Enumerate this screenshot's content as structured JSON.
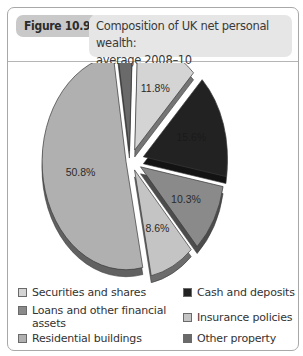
{
  "figure": {
    "label": "Figure 10.9",
    "title_line1": "Composition of UK net personal wealth:",
    "title_line2": "average 2008–10"
  },
  "chart_data": {
    "type": "pie",
    "title": "Composition of UK net personal wealth: average 2008–10",
    "style": "3D exploded pie",
    "categories": [
      "Securities and shares",
      "Cash and deposits",
      "Loans and other financial assets",
      "Insurance policies",
      "Residential buildings",
      "Other property"
    ],
    "values": [
      11.8,
      15.6,
      10.3,
      8.6,
      50.8,
      3.0
    ],
    "unit": "%",
    "data_labels": [
      "11.8%",
      "15.6%",
      "10.3%",
      "8.6%",
      "50.8%",
      "3.0%"
    ],
    "colors": [
      "#d4d4d4",
      "#222222",
      "#8a8a8a",
      "#c4c4c4",
      "#b0b0b0",
      "#6a6a6a"
    ],
    "legend_position": "bottom"
  },
  "legend": {
    "items": [
      {
        "label": "Securities and shares",
        "color": "#d4d4d4"
      },
      {
        "label": "Cash and deposits",
        "color": "#222222"
      },
      {
        "label": "Loans and other financial",
        "label2": "assets",
        "color": "#8a8a8a"
      },
      {
        "label": "Insurance policies",
        "color": "#c4c4c4"
      },
      {
        "label": "Residential buildings",
        "color": "#b0b0b0"
      },
      {
        "label": "Other property",
        "color": "#6a6a6a"
      }
    ]
  }
}
